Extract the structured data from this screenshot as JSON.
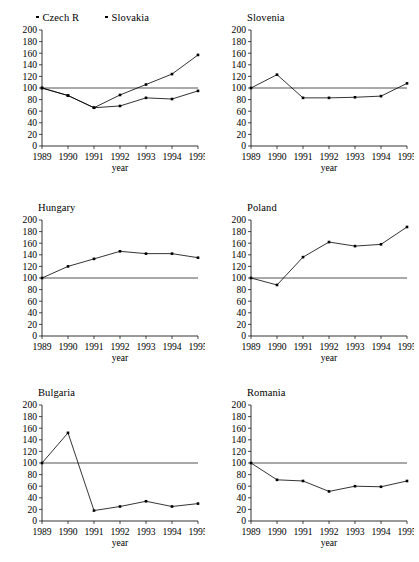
{
  "figure": {
    "axis": {
      "y_ticks": [
        0,
        20,
        40,
        60,
        80,
        100,
        120,
        140,
        160,
        180,
        200
      ],
      "x_ticks": [
        "1989",
        "1990",
        "1991",
        "1992",
        "1993",
        "1994",
        "1995"
      ],
      "xlabel": "year",
      "reference_value": 100
    },
    "legend": {
      "items": [
        {
          "label": "Czech R",
          "marker": "square-marker"
        },
        {
          "label": "Slovakia",
          "marker": "square-marker"
        }
      ]
    },
    "panels": [
      {
        "id": "czech-slovakia",
        "title": ""
      },
      {
        "id": "slovenia",
        "title": "Slovenia"
      },
      {
        "id": "hungary",
        "title": "Hungary"
      },
      {
        "id": "poland",
        "title": "Poland"
      },
      {
        "id": "bulgaria",
        "title": "Bulgaria"
      },
      {
        "id": "romania",
        "title": "Romania"
      }
    ]
  },
  "chart_data": [
    {
      "type": "line",
      "title": "",
      "xlabel": "year",
      "ylabel": "",
      "x": [
        1989,
        1990,
        1991,
        1992,
        1993,
        1994,
        1995
      ],
      "categories": [
        "1989",
        "1990",
        "1991",
        "1992",
        "1993",
        "1994",
        "1995"
      ],
      "ylim": [
        0,
        200
      ],
      "grid": false,
      "legend_position": "top",
      "reference_line": 100,
      "series": [
        {
          "name": "Czech R",
          "values": [
            100,
            87,
            66,
            88,
            106,
            124,
            157
          ]
        },
        {
          "name": "Slovakia",
          "values": [
            100,
            87,
            66,
            69,
            83,
            81,
            95
          ]
        }
      ]
    },
    {
      "type": "line",
      "title": "Slovenia",
      "xlabel": "year",
      "ylabel": "",
      "x": [
        1989,
        1990,
        1991,
        1992,
        1993,
        1994,
        1995
      ],
      "categories": [
        "1989",
        "1990",
        "1991",
        "1992",
        "1993",
        "1994",
        "1995"
      ],
      "ylim": [
        0,
        200
      ],
      "grid": false,
      "reference_line": 100,
      "series": [
        {
          "name": "Slovenia",
          "values": [
            100,
            123,
            83,
            83,
            84,
            86,
            108
          ]
        }
      ]
    },
    {
      "type": "line",
      "title": "Hungary",
      "xlabel": "year",
      "ylabel": "",
      "x": [
        1989,
        1990,
        1991,
        1992,
        1993,
        1994,
        1995
      ],
      "categories": [
        "1989",
        "1990",
        "1991",
        "1992",
        "1993",
        "1994",
        "1995"
      ],
      "ylim": [
        0,
        200
      ],
      "grid": false,
      "reference_line": 100,
      "series": [
        {
          "name": "Hungary",
          "values": [
            100,
            120,
            133,
            146,
            142,
            142,
            135
          ]
        }
      ]
    },
    {
      "type": "line",
      "title": "Poland",
      "xlabel": "year",
      "ylabel": "",
      "x": [
        1989,
        1990,
        1991,
        1992,
        1993,
        1994,
        1995
      ],
      "categories": [
        "1989",
        "1990",
        "1991",
        "1992",
        "1993",
        "1994",
        "1995"
      ],
      "ylim": [
        0,
        200
      ],
      "grid": false,
      "reference_line": 100,
      "series": [
        {
          "name": "Poland",
          "values": [
            100,
            88,
            136,
            162,
            155,
            158,
            188
          ]
        }
      ]
    },
    {
      "type": "line",
      "title": "Bulgaria",
      "xlabel": "year",
      "ylabel": "",
      "x": [
        1989,
        1990,
        1991,
        1992,
        1993,
        1994,
        1995
      ],
      "categories": [
        "1989",
        "1990",
        "1991",
        "1992",
        "1993",
        "1994",
        "1995"
      ],
      "ylim": [
        0,
        200
      ],
      "grid": false,
      "reference_line": 100,
      "series": [
        {
          "name": "Bulgaria",
          "values": [
            100,
            152,
            18,
            25,
            34,
            25,
            30
          ]
        }
      ]
    },
    {
      "type": "line",
      "title": "Romania",
      "xlabel": "year",
      "ylabel": "",
      "x": [
        1989,
        1990,
        1991,
        1992,
        1993,
        1994,
        1995
      ],
      "categories": [
        "1989",
        "1990",
        "1991",
        "1992",
        "1993",
        "1994",
        "1995"
      ],
      "ylim": [
        0,
        200
      ],
      "grid": false,
      "reference_line": 100,
      "series": [
        {
          "name": "Romania",
          "values": [
            100,
            71,
            69,
            51,
            60,
            59,
            69
          ]
        }
      ]
    }
  ],
  "colors": {
    "line": "#000000",
    "reference_line": "#555555",
    "background": "#ffffff"
  }
}
